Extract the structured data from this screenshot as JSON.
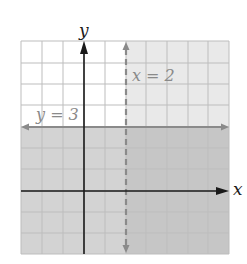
{
  "figure": {
    "x_axis_label": "x",
    "y_axis_label": "y",
    "x_range": [
      -3,
      7
    ],
    "y_range": [
      -3,
      7
    ],
    "grid_step": 1,
    "lines": [
      {
        "name": "vertical-boundary",
        "equation": "x = 2",
        "label": "x = 2",
        "style": "dashed",
        "color": "#8a8a8a"
      },
      {
        "name": "horizontal-boundary",
        "equation": "y = 3",
        "label": "y = 3",
        "style": "solid",
        "color": "#8a8a8a"
      }
    ],
    "regions": [
      {
        "name": "right-of-x2",
        "description": "x > 2",
        "color": "#e6e6e6"
      },
      {
        "name": "below-y3",
        "description": "y ≤ 3",
        "color": "#cfcfcf"
      },
      {
        "name": "overlap",
        "description": "x > 2 and y ≤ 3",
        "color": "#c2c2c2"
      }
    ],
    "colors": {
      "grid": "#bdbdbd",
      "axis": "#1a1a1a",
      "background": "#ffffff"
    }
  }
}
